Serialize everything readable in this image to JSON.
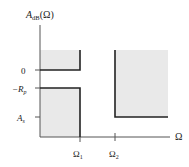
{
  "diagram": {
    "y_axis": {
      "label_main": "A",
      "label_sub": "dB",
      "label_arg": "(Ω)",
      "ticks": [
        {
          "label": "0",
          "y": 70
        },
        {
          "label_main": "−R",
          "label_sub": "p",
          "y": 88
        },
        {
          "label_main": "A",
          "label_sub": "s",
          "y": 117
        }
      ]
    },
    "x_axis": {
      "label": "Ω",
      "ticks": [
        {
          "label_main": "Ω",
          "label_sub": "1",
          "x": 80
        },
        {
          "label_main": "Ω",
          "label_sub": "2",
          "x": 115
        }
      ]
    },
    "regions": [
      {
        "name": "passband-upper-forbidden",
        "x0": 40,
        "x1": 80,
        "y0": 50,
        "y1": 70
      },
      {
        "name": "passband-lower-forbidden",
        "x0": 40,
        "x1": 80,
        "y0": 88,
        "y1": 137
      },
      {
        "name": "stopband-forbidden",
        "x0": 115,
        "x1": 168,
        "y0": 50,
        "y1": 117
      }
    ],
    "colors": {
      "shade": "#e9e9e9",
      "line": "#222222",
      "axis": "#555555"
    }
  }
}
